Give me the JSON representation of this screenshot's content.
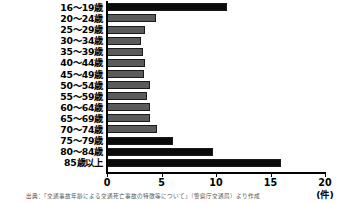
{
  "chart_data": {
    "type": "bar",
    "orientation": "horizontal",
    "title": "",
    "xlabel": "(件)",
    "ylabel": "",
    "xlim": [
      0,
      20
    ],
    "xticks": [
      0,
      5,
      10,
      15,
      20
    ],
    "grid": false,
    "legend": false,
    "categories": [
      "16～19歳",
      "20～24歳",
      "25～29歳",
      "30～34歳",
      "35～39歳",
      "40～44歳",
      "45～49歳",
      "50～54歳",
      "55～59歳",
      "60～64歳",
      "65～69歳",
      "70～74歳",
      "75～79歳",
      "80～84歳",
      "85歳以上"
    ],
    "values": [
      11.0,
      4.5,
      3.5,
      3.1,
      3.3,
      3.5,
      3.4,
      3.9,
      3.7,
      3.9,
      3.9,
      4.6,
      6.1,
      9.7,
      16.0
    ],
    "bar_colors": [
      "black",
      "gray",
      "gray",
      "gray",
      "gray",
      "gray",
      "gray",
      "gray",
      "gray",
      "gray",
      "gray",
      "gray",
      "black",
      "black",
      "black"
    ],
    "colors": {
      "gray": "#5b5b5b",
      "black": "#0b0b0b",
      "axis": "#000000",
      "background": "#ffffff"
    }
  },
  "axis": {
    "unit_label": "(件)",
    "tick_labels": [
      "0",
      "5",
      "10",
      "15",
      "20"
    ]
  },
  "footnote": {
    "text": "出典：「交通事故年齢による交通死亡事故の特徴等について」（警察庁交通局）より作成"
  }
}
